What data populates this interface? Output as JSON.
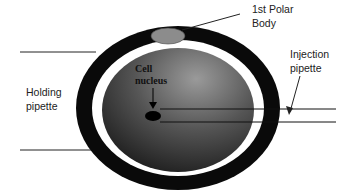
{
  "diagram": {
    "type": "oocyte microinjection schematic",
    "labels": {
      "polar_body": [
        "1st Polar",
        "Body"
      ],
      "injection_pipette": [
        "Injection",
        "pipette"
      ],
      "holding_pipette": [
        "Holding",
        "pipette"
      ],
      "cell_nucleus": [
        "Cell",
        "nucleus"
      ]
    },
    "colors": {
      "zona": "#0a0a0a",
      "perivitelline": "#ffffff",
      "cytoplasm_dark": "#1a1a1a",
      "cytoplasm_light": "#8a8a8a",
      "polar_body": "#8c8c8c",
      "nucleus": "#000000",
      "line": "#222222"
    }
  }
}
